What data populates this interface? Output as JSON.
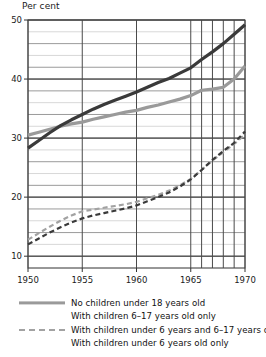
{
  "chart_data": {
    "type": "line",
    "title": "",
    "ylabel": "Per cent",
    "xlabel": "",
    "ylim": [
      8,
      50
    ],
    "xlim": [
      1950,
      1970
    ],
    "grid": true,
    "y_major_ticks": [
      50,
      40,
      30,
      20,
      10
    ],
    "y_minor_step": 2,
    "x_major_ticks": [
      1950,
      1955,
      1960,
      1965,
      1970
    ],
    "x_gridlines": [
      1950,
      1955,
      1960,
      1965,
      1966,
      1967,
      1968,
      1969,
      1970
    ],
    "legend_position": "below",
    "x": [
      1950,
      1951,
      1952,
      1953,
      1954,
      1955,
      1956,
      1957,
      1958,
      1959,
      1960,
      1961,
      1962,
      1963,
      1964,
      1965,
      1966,
      1967,
      1968,
      1969,
      1970
    ],
    "series": [
      {
        "name": "No children under 18 years old",
        "style": "solid",
        "color": "#9a9a9a",
        "width": 3.2,
        "values": [
          30.5,
          31.0,
          31.5,
          32.0,
          32.4,
          32.7,
          33.2,
          33.6,
          34.0,
          34.4,
          34.7,
          35.2,
          35.6,
          36.1,
          36.6,
          37.2,
          38.1,
          38.3,
          38.6,
          40.0,
          42.2
        ]
      },
      {
        "name": "With children 6-17 years old only",
        "style": "solid",
        "color": "#3a3a3a",
        "width": 3.2,
        "values": [
          28.3,
          29.6,
          30.9,
          32.1,
          33.1,
          34.0,
          34.9,
          35.7,
          36.4,
          37.1,
          37.8,
          38.6,
          39.4,
          40.1,
          41.0,
          41.9,
          43.3,
          44.6,
          46.0,
          47.6,
          49.2
        ]
      },
      {
        "name": "With children under 6 years and 6-17 years old",
        "style": "dashed",
        "color": "#a2a2a2",
        "width": 2.2,
        "values": [
          12.8,
          13.9,
          15.0,
          16.0,
          16.9,
          17.6,
          17.9,
          18.2,
          18.5,
          18.8,
          19.2,
          19.8,
          20.4,
          21.1,
          22.0,
          23.1,
          24.6,
          26.2,
          27.6,
          29.0,
          30.6
        ]
      },
      {
        "name": "With children under 6 years old only",
        "style": "dashed",
        "color": "#3a3a3a",
        "width": 2.2,
        "values": [
          12.0,
          13.0,
          14.0,
          14.9,
          15.7,
          16.4,
          16.9,
          17.3,
          17.7,
          18.1,
          18.6,
          19.3,
          20.0,
          20.8,
          21.8,
          23.0,
          24.6,
          26.3,
          27.8,
          29.2,
          31.1
        ]
      }
    ]
  },
  "axis": {
    "y_title": "Per cent",
    "y_labels": [
      "50",
      "40",
      "30",
      "20",
      "10"
    ],
    "x_labels": [
      "1950",
      "1955",
      "1960",
      "1965",
      "1970"
    ]
  },
  "legend": {
    "items": [
      {
        "label": "No children under 18 years old",
        "swatch": "solid-gray"
      },
      {
        "label": "With children 6–17 years old only",
        "swatch": "none"
      },
      {
        "label": "With children under 6 years and 6–17 years old",
        "swatch": "dash-gray"
      },
      {
        "label": "With children under 6 years old only",
        "swatch": "none"
      }
    ]
  }
}
